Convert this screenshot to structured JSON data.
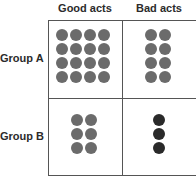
{
  "columns": [
    "Good acts",
    "Bad acts"
  ],
  "rows": [
    "Group A",
    "Group B"
  ],
  "colors": {
    "good": "#6b6b6b",
    "bad_a": "#6b6b6b",
    "bad_b": "#2a2a2a",
    "border": "#555555"
  },
  "cells": {
    "A_good": {
      "count": 16,
      "cols": 4
    },
    "A_bad": {
      "count": 8,
      "cols": 2
    },
    "B_good": {
      "count": 6,
      "cols": 2
    },
    "B_bad": {
      "count": 3,
      "cols": 1
    }
  }
}
